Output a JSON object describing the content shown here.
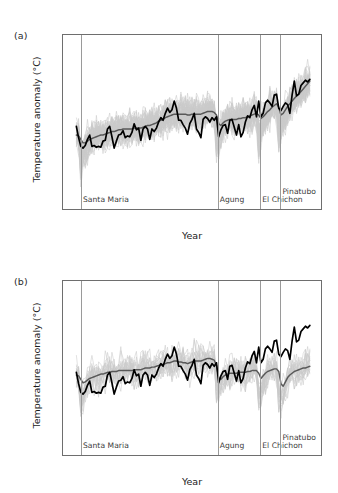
{
  "figure": {
    "background": "#ffffff",
    "colors": {
      "observations": "#000000",
      "ensemble_mean": "#585858",
      "ensemble_members": "#c9c9c9",
      "volcano_line": "#9a9a9a",
      "axis": "#6e6e6e"
    }
  },
  "panels": [
    {
      "id": "a",
      "label": "(a)",
      "xlabel": "Year",
      "ylabel": "Temperature anomaly (°C)",
      "xticks": [
        1900,
        1920,
        1940,
        1960,
        1980,
        2000
      ],
      "xtick_labels": [
        "1900",
        "1920",
        "1940",
        "1960",
        "1980",
        "2000"
      ],
      "yticks": [
        -1.0,
        -0.5,
        0.0,
        0.5,
        1.0
      ],
      "ytick_labels": [
        "−1.0",
        "−0.5",
        "0.0",
        "0.5",
        "1.0"
      ],
      "xlim": [
        1894,
        2010
      ],
      "ylim": [
        -1.0,
        1.0
      ],
      "volcanoes": [
        {
          "name": "Santa Maria",
          "year": 1902,
          "label_y": 0.82,
          "align": "left"
        },
        {
          "name": "Agung",
          "year": 1963,
          "label_y": 0.82,
          "align": "left"
        },
        {
          "name": "El Chichon",
          "year": 1982,
          "label_y": 0.82,
          "align": "left"
        },
        {
          "name": "Pinatubo",
          "year": 1991,
          "label_y": 0.73,
          "align": "left"
        }
      ]
    },
    {
      "id": "b",
      "label": "(b)",
      "xlabel": "Year",
      "ylabel": "Temperature anomaly (°C)",
      "xticks": [
        1900,
        1920,
        1940,
        1960,
        1980,
        2000
      ],
      "xtick_labels": [
        "1900",
        "1920",
        "1940",
        "1960",
        "1980",
        "2000"
      ],
      "yticks": [
        -1.0,
        -0.5,
        0.0,
        0.5,
        1.0
      ],
      "ytick_labels": [
        "−1.0",
        "−0.5",
        "0.0",
        "0.5",
        "1.0"
      ],
      "xlim": [
        1894,
        2010
      ],
      "ylim": [
        -1.0,
        1.0
      ],
      "volcanoes": [
        {
          "name": "Santa Maria",
          "year": 1902,
          "label_y": 0.82,
          "align": "left"
        },
        {
          "name": "Agung",
          "year": 1963,
          "label_y": 0.82,
          "align": "left"
        },
        {
          "name": "El Chichon",
          "year": 1982,
          "label_y": 0.82,
          "align": "left"
        },
        {
          "name": "Pinatubo",
          "year": 1991,
          "label_y": 0.73,
          "align": "left"
        }
      ]
    }
  ],
  "chart_data": [
    {
      "type": "line",
      "panel": "a",
      "title": "",
      "xlabel": "Year",
      "ylabel": "Temperature anomaly (°C)",
      "xlim": [
        1894,
        2010
      ],
      "ylim": [
        -1.0,
        1.0
      ],
      "grid": false,
      "legend": "none",
      "x": [
        1900,
        1901,
        1902,
        1903,
        1904,
        1905,
        1906,
        1907,
        1908,
        1909,
        1910,
        1911,
        1912,
        1913,
        1914,
        1915,
        1916,
        1917,
        1918,
        1919,
        1920,
        1921,
        1922,
        1923,
        1924,
        1925,
        1926,
        1927,
        1928,
        1929,
        1930,
        1931,
        1932,
        1933,
        1934,
        1935,
        1936,
        1937,
        1938,
        1939,
        1940,
        1941,
        1942,
        1943,
        1944,
        1945,
        1946,
        1947,
        1948,
        1949,
        1950,
        1951,
        1952,
        1953,
        1954,
        1955,
        1956,
        1957,
        1958,
        1959,
        1960,
        1961,
        1962,
        1963,
        1964,
        1965,
        1966,
        1967,
        1968,
        1969,
        1970,
        1971,
        1972,
        1973,
        1974,
        1975,
        1976,
        1977,
        1978,
        1979,
        1980,
        1981,
        1982,
        1983,
        1984,
        1985,
        1986,
        1987,
        1988,
        1989,
        1990,
        1991,
        1992,
        1993,
        1994,
        1995,
        1996,
        1997,
        1998,
        1999,
        2000,
        2001,
        2002,
        2003,
        2004,
        2005
      ],
      "series": [
        {
          "name": "Observations",
          "color": "#000000",
          "values": [
            -0.05,
            -0.18,
            -0.28,
            -0.3,
            -0.27,
            -0.2,
            -0.15,
            -0.28,
            -0.27,
            -0.29,
            -0.28,
            -0.29,
            -0.22,
            -0.21,
            -0.08,
            -0.05,
            -0.17,
            -0.3,
            -0.22,
            -0.15,
            -0.14,
            -0.1,
            -0.18,
            -0.16,
            -0.17,
            -0.12,
            -0.02,
            -0.09,
            -0.07,
            -0.21,
            -0.08,
            -0.05,
            -0.08,
            -0.2,
            -0.08,
            -0.11,
            -0.07,
            0.0,
            0.05,
            0.02,
            0.1,
            0.16,
            0.11,
            0.14,
            0.24,
            0.16,
            0.02,
            0.02,
            -0.03,
            -0.07,
            -0.14,
            -0.02,
            0.03,
            0.1,
            -0.08,
            -0.12,
            -0.18,
            0.03,
            0.06,
            0.04,
            0.0,
            0.05,
            0.02,
            0.06,
            -0.17,
            -0.09,
            -0.04,
            -0.03,
            -0.13,
            0.02,
            0.03,
            -0.06,
            -0.15,
            -0.03,
            -0.17,
            -0.12,
            0.0,
            0.07,
            0.05,
            0.14,
            0.19,
            0.06,
            0.24,
            0.06,
            0.1,
            0.22,
            0.25,
            0.22,
            0.18,
            0.31,
            0.32,
            0.16,
            0.13,
            0.18,
            0.22,
            0.2,
            0.1,
            0.31,
            0.47,
            0.3,
            0.32,
            0.42,
            0.45,
            0.48,
            0.46,
            0.49
          ]
        },
        {
          "name": "Model ensemble mean (anthropogenic + natural forcings)",
          "color": "#585858",
          "values": [
            -0.15,
            -0.16,
            -0.2,
            -0.24,
            -0.24,
            -0.22,
            -0.2,
            -0.19,
            -0.18,
            -0.17,
            -0.16,
            -0.15,
            -0.15,
            -0.14,
            -0.13,
            -0.12,
            -0.11,
            -0.11,
            -0.1,
            -0.09,
            -0.09,
            -0.08,
            -0.08,
            -0.08,
            -0.08,
            -0.08,
            -0.07,
            -0.07,
            -0.07,
            -0.07,
            -0.06,
            -0.05,
            -0.04,
            -0.04,
            -0.03,
            -0.02,
            -0.01,
            0.01,
            0.02,
            0.03,
            0.05,
            0.06,
            0.07,
            0.08,
            0.09,
            0.09,
            0.09,
            0.09,
            0.09,
            0.09,
            0.08,
            0.08,
            0.09,
            0.09,
            0.09,
            0.09,
            0.09,
            0.1,
            0.11,
            0.12,
            0.12,
            0.12,
            0.11,
            0.08,
            -0.02,
            -0.04,
            -0.01,
            0.01,
            0.02,
            0.03,
            0.03,
            0.03,
            0.03,
            0.04,
            0.04,
            0.05,
            0.05,
            0.06,
            0.07,
            0.08,
            0.09,
            0.1,
            0.08,
            0.04,
            0.06,
            0.09,
            0.12,
            0.14,
            0.17,
            0.19,
            0.21,
            0.17,
            0.08,
            0.1,
            0.14,
            0.18,
            0.21,
            0.24,
            0.27,
            0.3,
            0.32,
            0.35,
            0.38,
            0.41,
            0.44,
            0.47
          ]
        }
      ],
      "ensemble_band": {
        "name": "Individual model simulations",
        "color": "#c9c9c9",
        "n_members": 58,
        "description": "Spaghetti of individual runs enveloping the ensemble mean; spread roughly ±0.25 °C widening after volcanic eruptions"
      }
    },
    {
      "type": "line",
      "panel": "b",
      "title": "",
      "xlabel": "Year",
      "ylabel": "Temperature anomaly (°C)",
      "xlim": [
        1894,
        2010
      ],
      "ylim": [
        -1.0,
        1.0
      ],
      "grid": false,
      "legend": "none",
      "x": [
        1900,
        1901,
        1902,
        1903,
        1904,
        1905,
        1906,
        1907,
        1908,
        1909,
        1910,
        1911,
        1912,
        1913,
        1914,
        1915,
        1916,
        1917,
        1918,
        1919,
        1920,
        1921,
        1922,
        1923,
        1924,
        1925,
        1926,
        1927,
        1928,
        1929,
        1930,
        1931,
        1932,
        1933,
        1934,
        1935,
        1936,
        1937,
        1938,
        1939,
        1940,
        1941,
        1942,
        1943,
        1944,
        1945,
        1946,
        1947,
        1948,
        1949,
        1950,
        1951,
        1952,
        1953,
        1954,
        1955,
        1956,
        1957,
        1958,
        1959,
        1960,
        1961,
        1962,
        1963,
        1964,
        1965,
        1966,
        1967,
        1968,
        1969,
        1970,
        1971,
        1972,
        1973,
        1974,
        1975,
        1976,
        1977,
        1978,
        1979,
        1980,
        1981,
        1982,
        1983,
        1984,
        1985,
        1986,
        1987,
        1988,
        1989,
        1990,
        1991,
        1992,
        1993,
        1994,
        1995,
        1996,
        1997,
        1998,
        1999,
        2000,
        2001,
        2002,
        2003,
        2004,
        2005
      ],
      "series": [
        {
          "name": "Observations",
          "color": "#000000",
          "values": [
            -0.05,
            -0.18,
            -0.28,
            -0.3,
            -0.27,
            -0.2,
            -0.15,
            -0.28,
            -0.27,
            -0.29,
            -0.28,
            -0.29,
            -0.22,
            -0.21,
            -0.08,
            -0.05,
            -0.17,
            -0.3,
            -0.22,
            -0.15,
            -0.14,
            -0.1,
            -0.18,
            -0.16,
            -0.17,
            -0.12,
            -0.02,
            -0.09,
            -0.07,
            -0.21,
            -0.08,
            -0.05,
            -0.08,
            -0.2,
            -0.08,
            -0.11,
            -0.07,
            0.0,
            0.05,
            0.02,
            0.1,
            0.16,
            0.11,
            0.14,
            0.24,
            0.16,
            0.02,
            0.02,
            -0.03,
            -0.07,
            -0.14,
            -0.02,
            0.03,
            0.1,
            -0.08,
            -0.12,
            -0.18,
            0.03,
            0.06,
            0.04,
            0.0,
            0.05,
            0.02,
            0.06,
            -0.17,
            -0.09,
            -0.04,
            -0.03,
            -0.13,
            0.02,
            0.03,
            -0.06,
            -0.15,
            -0.03,
            -0.17,
            -0.12,
            0.0,
            0.07,
            0.05,
            0.14,
            0.19,
            0.06,
            0.24,
            0.06,
            0.1,
            0.22,
            0.25,
            0.22,
            0.18,
            0.31,
            0.32,
            0.16,
            0.13,
            0.18,
            0.22,
            0.2,
            0.1,
            0.31,
            0.47,
            0.3,
            0.32,
            0.42,
            0.45,
            0.48,
            0.46,
            0.49
          ]
        },
        {
          "name": "Model ensemble mean (natural forcings only)",
          "color": "#585858",
          "values": [
            -0.08,
            -0.09,
            -0.13,
            -0.17,
            -0.16,
            -0.14,
            -0.12,
            -0.11,
            -0.1,
            -0.09,
            -0.08,
            -0.07,
            -0.07,
            -0.06,
            -0.05,
            -0.05,
            -0.04,
            -0.04,
            -0.04,
            -0.03,
            -0.03,
            -0.03,
            -0.03,
            -0.03,
            -0.03,
            -0.03,
            -0.02,
            -0.02,
            -0.02,
            -0.02,
            -0.01,
            0.0,
            0.0,
            0.0,
            0.01,
            0.01,
            0.02,
            0.03,
            0.04,
            0.04,
            0.05,
            0.06,
            0.06,
            0.07,
            0.08,
            0.08,
            0.07,
            0.07,
            0.06,
            0.06,
            0.05,
            0.06,
            0.07,
            0.08,
            0.08,
            0.08,
            0.08,
            0.09,
            0.1,
            0.11,
            0.11,
            0.1,
            0.09,
            0.03,
            -0.11,
            -0.13,
            -0.1,
            -0.08,
            -0.07,
            -0.06,
            -0.06,
            -0.06,
            -0.06,
            -0.05,
            -0.05,
            -0.05,
            -0.05,
            -0.04,
            -0.04,
            -0.03,
            -0.03,
            -0.03,
            -0.06,
            -0.12,
            -0.09,
            -0.06,
            -0.04,
            -0.03,
            -0.02,
            -0.01,
            -0.01,
            -0.04,
            -0.18,
            -0.21,
            -0.16,
            -0.11,
            -0.08,
            -0.06,
            -0.04,
            -0.03,
            -0.02,
            -0.01,
            0.0,
            0.0,
            0.01,
            0.02
          ]
        }
      ],
      "ensemble_band": {
        "name": "Individual model simulations",
        "color": "#c9c9c9",
        "n_members": 19,
        "description": "Spaghetti of natural-forcing-only runs; stays near zero through the record with deep dips after each eruption"
      }
    }
  ]
}
